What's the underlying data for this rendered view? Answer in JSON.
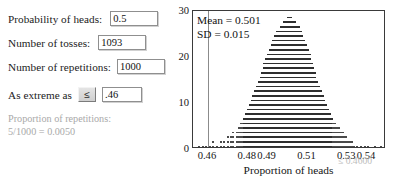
{
  "panel": {
    "fields": [
      {
        "label": "Probability of heads:",
        "value": "0.5"
      },
      {
        "label": "Number of tosses:",
        "value": "1093"
      },
      {
        "label": "Number of repetitions:",
        "value": "1000"
      }
    ],
    "extreme": {
      "label": "As extreme as",
      "operator": "≤",
      "value": ".46"
    },
    "proportion_note": {
      "line1": "Proportion of repetitions:",
      "line2": "5/1000 = 0.0050"
    }
  },
  "chart_annotations": {
    "mean_label": "Mean =",
    "mean_value": "0.501",
    "sd_label": "SD =",
    "sd_value": "0.015",
    "cut_label": "≤ 0.4600"
  },
  "chart_data": {
    "type": "scatter",
    "title": "",
    "xlabel": "Proportion of heads",
    "ylabel": "",
    "xticks": [
      "0.46",
      "0.48",
      "0.49",
      "0.51",
      "0.53",
      "0.54"
    ],
    "xtick_values": [
      0.46,
      0.48,
      0.49,
      0.51,
      0.53,
      0.54
    ],
    "yticks": [
      "0",
      "10",
      "20",
      "30"
    ],
    "ytick_values": [
      0,
      10,
      20,
      30
    ],
    "xlim": [
      0.4525,
      0.5495
    ],
    "ylim": [
      0,
      30
    ],
    "grid": false,
    "legend": null,
    "mean": 0.501,
    "sd": 0.015,
    "n_repetitions": 1000,
    "n_tosses": 1093,
    "cutoff": 0.46,
    "count_at_or_below_cutoff": 5,
    "proportion_at_or_below_cutoff": 0.005,
    "bin_width": 0.000915,
    "bins": [
      {
        "x": 0.455,
        "count": 1
      },
      {
        "x": 0.4568,
        "count": 1
      },
      {
        "x": 0.4586,
        "count": 1
      },
      {
        "x": 0.4604,
        "count": 1
      },
      {
        "x": 0.4622,
        "count": 2
      },
      {
        "x": 0.464,
        "count": 1
      },
      {
        "x": 0.4659,
        "count": 2
      },
      {
        "x": 0.4677,
        "count": 2
      },
      {
        "x": 0.4695,
        "count": 3
      },
      {
        "x": 0.4713,
        "count": 3
      },
      {
        "x": 0.4722,
        "count": 4
      },
      {
        "x": 0.474,
        "count": 4
      },
      {
        "x": 0.475,
        "count": 5
      },
      {
        "x": 0.4759,
        "count": 6
      },
      {
        "x": 0.4768,
        "count": 6
      },
      {
        "x": 0.4777,
        "count": 7
      },
      {
        "x": 0.4786,
        "count": 8
      },
      {
        "x": 0.4795,
        "count": 9
      },
      {
        "x": 0.4805,
        "count": 10
      },
      {
        "x": 0.4814,
        "count": 11
      },
      {
        "x": 0.4823,
        "count": 12
      },
      {
        "x": 0.4832,
        "count": 13
      },
      {
        "x": 0.4841,
        "count": 14
      },
      {
        "x": 0.485,
        "count": 15
      },
      {
        "x": 0.486,
        "count": 16
      },
      {
        "x": 0.4869,
        "count": 17
      },
      {
        "x": 0.4878,
        "count": 19
      },
      {
        "x": 0.4887,
        "count": 20
      },
      {
        "x": 0.4896,
        "count": 21
      },
      {
        "x": 0.4905,
        "count": 22
      },
      {
        "x": 0.4915,
        "count": 23
      },
      {
        "x": 0.4924,
        "count": 24
      },
      {
        "x": 0.4933,
        "count": 25
      },
      {
        "x": 0.4942,
        "count": 26
      },
      {
        "x": 0.4951,
        "count": 26
      },
      {
        "x": 0.496,
        "count": 27
      },
      {
        "x": 0.497,
        "count": 27
      },
      {
        "x": 0.4979,
        "count": 28
      },
      {
        "x": 0.4988,
        "count": 28
      },
      {
        "x": 0.4997,
        "count": 29
      },
      {
        "x": 0.5006,
        "count": 29
      },
      {
        "x": 0.5015,
        "count": 29
      },
      {
        "x": 0.5024,
        "count": 28
      },
      {
        "x": 0.5034,
        "count": 28
      },
      {
        "x": 0.5043,
        "count": 27
      },
      {
        "x": 0.5052,
        "count": 27
      },
      {
        "x": 0.5061,
        "count": 26
      },
      {
        "x": 0.507,
        "count": 25
      },
      {
        "x": 0.5079,
        "count": 24
      },
      {
        "x": 0.5089,
        "count": 23
      },
      {
        "x": 0.5098,
        "count": 22
      },
      {
        "x": 0.5107,
        "count": 21
      },
      {
        "x": 0.5116,
        "count": 19
      },
      {
        "x": 0.5125,
        "count": 18
      },
      {
        "x": 0.5134,
        "count": 17
      },
      {
        "x": 0.5144,
        "count": 15
      },
      {
        "x": 0.5153,
        "count": 14
      },
      {
        "x": 0.5162,
        "count": 13
      },
      {
        "x": 0.5171,
        "count": 12
      },
      {
        "x": 0.518,
        "count": 11
      },
      {
        "x": 0.5189,
        "count": 10
      },
      {
        "x": 0.5199,
        "count": 9
      },
      {
        "x": 0.5208,
        "count": 8
      },
      {
        "x": 0.5217,
        "count": 7
      },
      {
        "x": 0.5226,
        "count": 6
      },
      {
        "x": 0.5235,
        "count": 6
      },
      {
        "x": 0.5244,
        "count": 5
      },
      {
        "x": 0.5254,
        "count": 5
      },
      {
        "x": 0.5263,
        "count": 4
      },
      {
        "x": 0.5272,
        "count": 4
      },
      {
        "x": 0.5281,
        "count": 3
      },
      {
        "x": 0.529,
        "count": 3
      },
      {
        "x": 0.5299,
        "count": 2
      },
      {
        "x": 0.5309,
        "count": 2
      },
      {
        "x": 0.5318,
        "count": 2
      },
      {
        "x": 0.5327,
        "count": 1
      },
      {
        "x": 0.5345,
        "count": 1
      },
      {
        "x": 0.5363,
        "count": 1
      },
      {
        "x": 0.5382,
        "count": 1
      },
      {
        "x": 0.54,
        "count": 1
      },
      {
        "x": 0.5436,
        "count": 1
      },
      {
        "x": 0.5463,
        "count": 1
      }
    ]
  }
}
